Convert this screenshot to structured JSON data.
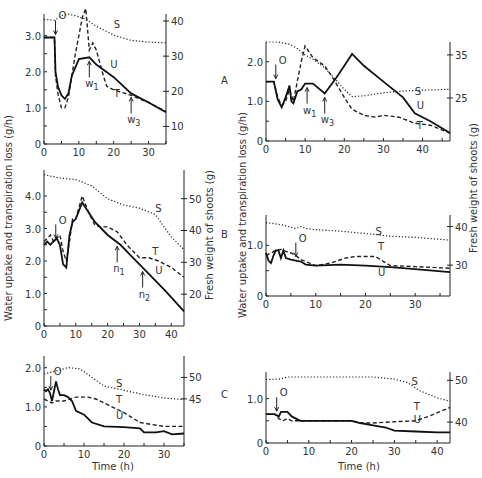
{
  "figure": {
    "left_ylabel": "Water uptake and transpiration loss (g/h)",
    "right_ylabel": "Fresh weight of shoots (g)",
    "xlabel": "Time (h)",
    "row_labels": [
      "A",
      "B",
      "C"
    ]
  },
  "chart_data": [
    {
      "type": "line",
      "panel": "A-left",
      "row": "A",
      "box": {
        "x0": 44,
        "x1": 166,
        "y0": 144,
        "y1": 14
      },
      "xlim": [
        0,
        35
      ],
      "ylim": [
        0,
        3.6
      ],
      "y2lim": [
        5,
        42
      ],
      "xticks": [
        0,
        10,
        20,
        30
      ],
      "yticks": [
        0,
        1.0,
        2.0,
        3.0
      ],
      "y2ticks": [
        10,
        20,
        30,
        40
      ],
      "xlabel": "",
      "ylabel": "Water uptake and transpiration loss (g/h)",
      "y2label": "",
      "series": [
        {
          "name": "S",
          "axis": "right",
          "x": [
            0,
            3,
            5,
            7,
            10,
            12,
            15,
            20,
            25,
            30,
            35
          ],
          "values": [
            40.5,
            40.2,
            41.5,
            42,
            41.2,
            40.5,
            38.5,
            36,
            34.5,
            34,
            33.8
          ]
        },
        {
          "name": "T",
          "axis": "left",
          "x": [
            0,
            3,
            3.3,
            4,
            5,
            6,
            7,
            9,
            11,
            12,
            13,
            14,
            15,
            17,
            18,
            20,
            25,
            30,
            35
          ],
          "values": [
            2.95,
            2.95,
            1.9,
            1.4,
            1.0,
            1.0,
            1.3,
            2.5,
            3.5,
            3.75,
            2.6,
            2.8,
            2.6,
            1.9,
            1.6,
            1.5,
            1.35,
            1.15,
            0.9
          ]
        },
        {
          "name": "U",
          "axis": "left",
          "x": [
            0,
            3,
            3.3,
            4,
            5,
            6,
            7,
            8,
            10,
            13,
            15,
            20,
            25,
            30,
            35
          ],
          "values": [
            2.95,
            2.95,
            2.0,
            1.6,
            1.35,
            1.25,
            1.4,
            1.9,
            2.35,
            2.4,
            2.2,
            1.85,
            1.4,
            1.15,
            0.88
          ]
        }
      ],
      "annotations": [
        {
          "text": "O",
          "x": 3.3,
          "kind": "arrow-down"
        },
        {
          "text": "w1",
          "x": 13,
          "kind": "arrow-up"
        },
        {
          "text": "w3",
          "x": 25,
          "kind": "arrow-up"
        },
        {
          "text": "S",
          "x": 20,
          "y": 3.2
        },
        {
          "text": "U",
          "x": 19,
          "y": 2.1
        },
        {
          "text": "T",
          "x": 20,
          "y": 1.3
        }
      ]
    },
    {
      "type": "line",
      "panel": "A-right",
      "row": "A",
      "box": {
        "x0": 266,
        "x1": 450,
        "y0": 141,
        "y1": 42
      },
      "xlim": [
        0,
        47
      ],
      "ylim": [
        0,
        2.5
      ],
      "y2lim": [
        15,
        38
      ],
      "xticks": [
        0,
        10,
        20,
        30,
        40
      ],
      "yticks": [
        0,
        1.0,
        2.0
      ],
      "y2ticks": [
        25,
        35
      ],
      "xlabel": "",
      "ylabel": "Water uptake and transpiration loss (g/h)",
      "y2label": "",
      "series": [
        {
          "name": "S",
          "axis": "right",
          "x": [
            0,
            3,
            6,
            8,
            10,
            12,
            15,
            18,
            20,
            22,
            25,
            30,
            35,
            40,
            47
          ],
          "values": [
            38,
            38,
            37.5,
            36.5,
            35,
            34,
            32,
            29,
            27,
            25.3,
            25.5,
            26.2,
            26.6,
            26.8,
            27
          ]
        },
        {
          "name": "T",
          "axis": "left",
          "x": [
            0,
            2,
            3,
            4,
            5,
            6,
            7,
            8,
            9,
            10,
            12,
            15,
            17,
            20,
            22,
            25,
            28,
            30,
            34,
            38,
            42,
            47
          ],
          "values": [
            1.5,
            1.5,
            1.1,
            0.9,
            1.0,
            1.3,
            1.0,
            1.5,
            2.0,
            2.4,
            2.1,
            1.9,
            1.6,
            1.1,
            0.8,
            0.65,
            0.6,
            0.65,
            0.6,
            0.45,
            0.4,
            0.2
          ]
        },
        {
          "name": "U",
          "axis": "left",
          "x": [
            0,
            2,
            3,
            4,
            5,
            6,
            6.5,
            7,
            8,
            9,
            10,
            12,
            15,
            18,
            20,
            22,
            25,
            30,
            35,
            38,
            42,
            47
          ],
          "values": [
            1.5,
            1.5,
            1.05,
            0.85,
            1.1,
            1.4,
            1.0,
            0.95,
            1.25,
            1.3,
            1.45,
            1.45,
            1.2,
            1.6,
            1.9,
            2.2,
            1.9,
            1.5,
            1.1,
            0.7,
            0.5,
            0.2
          ]
        }
      ],
      "annotations": [
        {
          "text": "O",
          "x": 2.5,
          "kind": "arrow-down"
        },
        {
          "text": "w1",
          "x": 10.5,
          "kind": "arrow-up"
        },
        {
          "text": "w3",
          "x": 15,
          "kind": "arrow-up"
        },
        {
          "text": "S",
          "x": 38,
          "y": 1.15
        },
        {
          "text": "U",
          "x": 38.5,
          "y": 0.8
        },
        {
          "text": "T",
          "x": 38.5,
          "y": 0.3
        }
      ]
    },
    {
      "type": "line",
      "panel": "B-left",
      "row": "B",
      "box": {
        "x0": 44,
        "x1": 184,
        "y0": 326,
        "y1": 170
      },
      "xlim": [
        0,
        44
      ],
      "ylim": [
        0,
        4.8
      ],
      "y2lim": [
        10,
        59
      ],
      "xticks": [
        0,
        10,
        20,
        30,
        40
      ],
      "yticks": [
        0,
        1.0,
        2.0,
        3.0,
        4.0
      ],
      "y2ticks": [
        20,
        30,
        40,
        50
      ],
      "xlabel": "",
      "ylabel": "Water uptake and transpiration loss (g/h)",
      "y2label": "Fresh weight of shoots (g)",
      "series": [
        {
          "name": "S",
          "axis": "right",
          "x": [
            0,
            5,
            10,
            15,
            20,
            25,
            30,
            35,
            40,
            44
          ],
          "values": [
            57.5,
            56.5,
            56,
            54,
            50,
            48,
            47,
            45,
            38,
            34
          ]
        },
        {
          "name": "T",
          "axis": "left",
          "x": [
            0,
            1,
            2,
            3,
            4,
            5,
            6,
            7,
            8,
            9,
            10,
            12,
            14,
            16,
            18,
            20,
            23,
            26,
            30,
            33,
            36,
            40,
            44
          ],
          "values": [
            2.6,
            2.7,
            2.8,
            2.6,
            2.7,
            2.8,
            2.3,
            2.0,
            2.6,
            3.3,
            3.3,
            4.0,
            3.5,
            3.1,
            3.05,
            3.05,
            2.9,
            2.5,
            2.1,
            2.1,
            2.0,
            1.8,
            1.5
          ]
        },
        {
          "name": "U",
          "axis": "left",
          "x": [
            0,
            1,
            2,
            3,
            4,
            5,
            6,
            7,
            8,
            9,
            10,
            12,
            16,
            20,
            24,
            28,
            30,
            34,
            38,
            44
          ],
          "values": [
            2.5,
            2.6,
            2.5,
            2.6,
            2.7,
            2.5,
            1.9,
            1.8,
            2.8,
            3.2,
            3.3,
            3.8,
            3.2,
            2.8,
            2.5,
            2.1,
            1.9,
            1.5,
            1.1,
            0.45
          ]
        }
      ],
      "annotations": [
        {
          "text": "O",
          "x": 3.7,
          "kind": "arrow-down"
        },
        {
          "text": "n1",
          "x": 23,
          "kind": "arrow-up"
        },
        {
          "text": "n2",
          "x": 31,
          "kind": "arrow-up"
        },
        {
          "text": "S",
          "x": 35,
          "y": 3.5
        },
        {
          "text": "T",
          "x": 34,
          "y": 2.2
        },
        {
          "text": "U",
          "x": 35,
          "y": 1.6
        }
      ]
    },
    {
      "type": "line",
      "panel": "B-right",
      "row": "B",
      "box": {
        "x0": 266,
        "x1": 450,
        "y0": 296,
        "y1": 215
      },
      "xlim": [
        0,
        37
      ],
      "ylim": [
        0,
        1.6
      ],
      "y2lim": [
        22,
        43
      ],
      "xticks": [
        0,
        10,
        20,
        30
      ],
      "yticks": [
        0,
        1.0
      ],
      "y2ticks": [
        30,
        40
      ],
      "xlabel": "",
      "ylabel": "Water uptake and transpiration loss (g/h)",
      "y2label": "Fresh weight of shoots (g)",
      "series": [
        {
          "name": "S",
          "axis": "right",
          "x": [
            0,
            3,
            6,
            7,
            8,
            10,
            15,
            20,
            25,
            30,
            37
          ],
          "values": [
            41,
            40.5,
            39.5,
            40,
            39.5,
            39.2,
            38.8,
            38.2,
            37.5,
            37.2,
            36.5
          ]
        },
        {
          "name": "T",
          "axis": "left",
          "x": [
            0,
            1,
            2,
            3,
            4,
            5,
            6,
            7,
            8,
            10,
            13,
            16,
            18,
            20,
            22,
            23,
            25,
            30,
            37
          ],
          "values": [
            0.8,
            0.85,
            0.9,
            0.92,
            0.88,
            0.85,
            0.8,
            0.72,
            0.68,
            0.6,
            0.65,
            0.75,
            0.78,
            0.78,
            0.78,
            0.72,
            0.6,
            0.58,
            0.55
          ]
        },
        {
          "name": "U",
          "axis": "left",
          "x": [
            0,
            0.5,
            1,
            1.5,
            2,
            2.5,
            3,
            3.5,
            4,
            5,
            6,
            7,
            8,
            10,
            15,
            20,
            25,
            30,
            37
          ],
          "values": [
            0.85,
            0.7,
            0.65,
            0.8,
            0.9,
            0.9,
            0.75,
            0.9,
            0.75,
            0.72,
            0.7,
            0.68,
            0.62,
            0.6,
            0.62,
            0.6,
            0.57,
            0.53,
            0.47
          ]
        }
      ],
      "annotations": [
        {
          "text": "O",
          "x": 6,
          "kind": "arrow-down"
        },
        {
          "text": "S",
          "x": 22,
          "y": 1.2
        },
        {
          "text": "T",
          "x": 22.5,
          "y": 0.9
        },
        {
          "text": "U",
          "x": 22.5,
          "y": 0.4
        }
      ]
    },
    {
      "type": "line",
      "panel": "C-left",
      "row": "C",
      "box": {
        "x0": 44,
        "x1": 184,
        "y0": 446,
        "y1": 356
      },
      "xlim": [
        0,
        35
      ],
      "ylim": [
        0,
        2.3
      ],
      "y2lim": [
        34,
        55
      ],
      "xticks": [
        0,
        10,
        20,
        30
      ],
      "yticks": [
        0,
        1.0,
        2.0
      ],
      "y2ticks": [
        45,
        50
      ],
      "xlabel": "Time (h)",
      "ylabel": "",
      "y2label": "",
      "series": [
        {
          "name": "S",
          "axis": "right",
          "x": [
            0,
            3,
            6,
            9,
            12,
            15,
            20,
            25,
            30,
            35
          ],
          "values": [
            50.8,
            51.5,
            52.3,
            52,
            50,
            48,
            47,
            46,
            45.2,
            44.8
          ]
        },
        {
          "name": "T",
          "axis": "left",
          "x": [
            0,
            1,
            2,
            3,
            5,
            8,
            11,
            13,
            16,
            20,
            24,
            27,
            30,
            35
          ],
          "values": [
            1.2,
            1.15,
            1.1,
            1.15,
            1.15,
            1.25,
            1.25,
            1.2,
            1.05,
            0.85,
            0.6,
            0.55,
            0.5,
            0.5
          ]
        },
        {
          "name": "U",
          "axis": "left",
          "x": [
            0,
            0.5,
            1,
            1.5,
            2,
            2.5,
            3,
            3.5,
            4,
            5,
            6,
            7,
            8,
            10,
            12,
            15,
            20,
            24,
            25,
            28,
            30,
            32,
            35
          ],
          "values": [
            1.45,
            1.4,
            1.45,
            1.35,
            1.15,
            1.4,
            1.65,
            1.45,
            1.3,
            1.3,
            1.25,
            1.15,
            0.9,
            0.8,
            0.6,
            0.5,
            0.48,
            0.45,
            0.35,
            0.35,
            0.38,
            0.3,
            0.32
          ]
        }
      ],
      "annotations": [
        {
          "text": "O",
          "x": 1.7,
          "kind": "arrow-down"
        },
        {
          "text": "S",
          "x": 18,
          "y": 1.5
        },
        {
          "text": "T",
          "x": 18,
          "y": 1.1
        },
        {
          "text": "U",
          "x": 18,
          "y": 0.7
        }
      ]
    },
    {
      "type": "line",
      "panel": "C-right",
      "row": "C",
      "box": {
        "x0": 266,
        "x1": 450,
        "y0": 443,
        "y1": 372
      },
      "xlim": [
        0,
        43
      ],
      "ylim": [
        0,
        1.6
      ],
      "y2lim": [
        35,
        52
      ],
      "xticks": [
        0,
        10,
        20,
        30,
        40
      ],
      "yticks": [
        0,
        1.0
      ],
      "y2ticks": [
        40,
        50
      ],
      "xlabel": "Time (h)",
      "ylabel": "",
      "y2label": "",
      "series": [
        {
          "name": "S",
          "axis": "right",
          "x": [
            0,
            3,
            5,
            10,
            20,
            25,
            30,
            33,
            36,
            40,
            43
          ],
          "values": [
            50.2,
            50.3,
            50.8,
            50.8,
            50.8,
            50.8,
            50.3,
            49.5,
            47.5,
            45.8,
            45
          ]
        },
        {
          "name": "T",
          "axis": "left",
          "x": [
            0,
            2,
            3,
            4,
            5,
            6,
            8,
            15,
            20,
            22,
            25,
            30,
            35,
            38,
            41,
            43
          ],
          "values": [
            0.65,
            0.65,
            0.55,
            0.5,
            0.55,
            0.5,
            0.5,
            0.5,
            0.5,
            0.45,
            0.45,
            0.48,
            0.5,
            0.6,
            0.72,
            0.8
          ]
        },
        {
          "name": "U",
          "axis": "left",
          "x": [
            0,
            2,
            3,
            3.5,
            5,
            6,
            8,
            10,
            15,
            20,
            22,
            25,
            28,
            30,
            35,
            40,
            43
          ],
          "values": [
            0.65,
            0.65,
            0.6,
            0.7,
            0.7,
            0.6,
            0.5,
            0.5,
            0.5,
            0.5,
            0.45,
            0.4,
            0.35,
            0.28,
            0.26,
            0.24,
            0.24
          ]
        }
      ],
      "annotations": [
        {
          "text": "O",
          "x": 2.5,
          "kind": "arrow-down"
        },
        {
          "text": "S",
          "x": 34,
          "y": 1.3
        },
        {
          "text": "T",
          "x": 34.5,
          "y": 0.75
        },
        {
          "text": "U",
          "x": 34.5,
          "y": 0.45
        }
      ]
    }
  ]
}
